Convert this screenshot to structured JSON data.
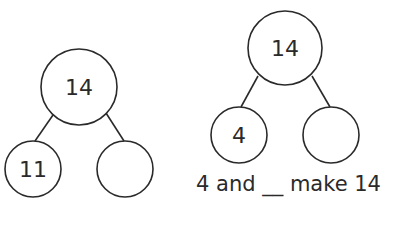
{
  "colors": {
    "stroke": "#2a2a2a",
    "background": "#ffffff"
  },
  "number_bonds": [
    {
      "whole": "14",
      "parts": [
        "11",
        ""
      ]
    },
    {
      "whole": "14",
      "parts": [
        "4",
        ""
      ],
      "sentence": "4 and __ make 14"
    }
  ]
}
